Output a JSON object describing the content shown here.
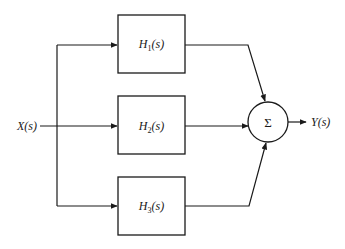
{
  "diagram": {
    "type": "parallel-block-diagram",
    "input": {
      "label": "X(s)"
    },
    "output": {
      "label": "Y(s)"
    },
    "blocks": [
      {
        "id": "H1",
        "base": "H",
        "sub": "1",
        "arg": "(s)"
      },
      {
        "id": "H2",
        "base": "H",
        "sub": "2",
        "arg": "(s)"
      },
      {
        "id": "H3",
        "base": "H",
        "sub": "3",
        "arg": "(s)"
      }
    ],
    "summer": {
      "symbol": "Σ"
    },
    "colors": {
      "stroke": "#1a1a1a",
      "background": "#ffffff"
    }
  }
}
